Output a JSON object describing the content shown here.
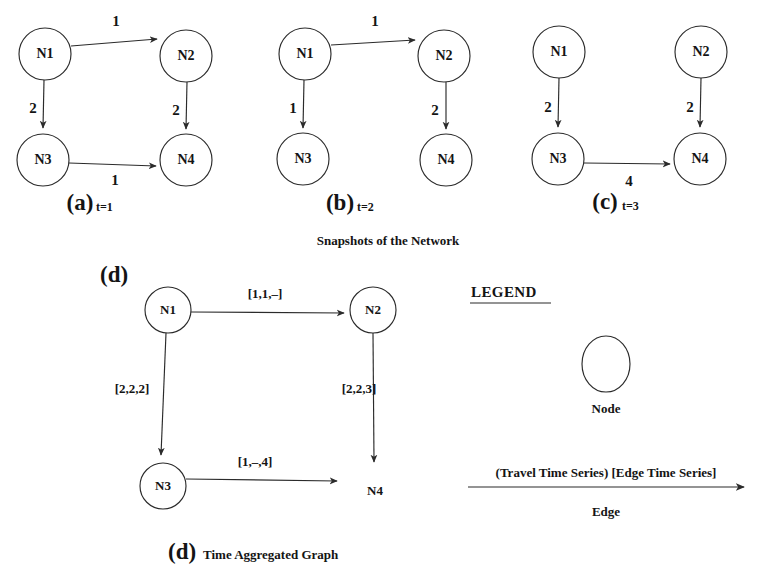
{
  "figure": {
    "snapshots_caption": "Snapshots of the Network",
    "tag_style_note": "bold serif"
  },
  "panels": [
    {
      "tag": "(a)",
      "time": "t=1",
      "nodes": [
        "N1",
        "N2",
        "N3",
        "N4"
      ],
      "edges": [
        {
          "from": "N1",
          "to": "N2",
          "weight": "1"
        },
        {
          "from": "N1",
          "to": "N3",
          "weight": "2"
        },
        {
          "from": "N2",
          "to": "N4",
          "weight": "2"
        },
        {
          "from": "N3",
          "to": "N4",
          "weight": "1"
        }
      ]
    },
    {
      "tag": "(b)",
      "time": "t=2",
      "nodes": [
        "N1",
        "N2",
        "N3",
        "N4"
      ],
      "edges": [
        {
          "from": "N1",
          "to": "N2",
          "weight": "1"
        },
        {
          "from": "N1",
          "to": "N3",
          "weight": "1"
        },
        {
          "from": "N2",
          "to": "N4",
          "weight": "2"
        }
      ]
    },
    {
      "tag": "(c)",
      "time": "t=3",
      "nodes": [
        "N1",
        "N2",
        "N3",
        "N4"
      ],
      "edges": [
        {
          "from": "N1",
          "to": "N3",
          "weight": "2"
        },
        {
          "from": "N2",
          "to": "N4",
          "weight": "2"
        },
        {
          "from": "N3",
          "to": "N4",
          "weight": "4"
        }
      ]
    }
  ],
  "aggregated": {
    "tag": "(d)",
    "caption_tag": "(d)",
    "caption_text": "Time Aggregated Graph",
    "nodes": [
      "N1",
      "N2",
      "N3",
      "N4"
    ],
    "edges": [
      {
        "from": "N1",
        "to": "N2",
        "series": "[1,1,–]"
      },
      {
        "from": "N1",
        "to": "N3",
        "series": "[2,2,2]"
      },
      {
        "from": "N2",
        "to": "N4",
        "series": "[2,2,3]"
      },
      {
        "from": "N3",
        "to": "N4",
        "series": "[1,–,4]"
      }
    ]
  },
  "legend": {
    "title": "LEGEND",
    "node_label": "Node",
    "edge_series_label": "(Travel Time Series) [Edge Time Series]",
    "edge_label": "Edge"
  },
  "colors": {
    "ink": "#2b2b2b",
    "text": "#141414",
    "background": "#ffffff"
  }
}
